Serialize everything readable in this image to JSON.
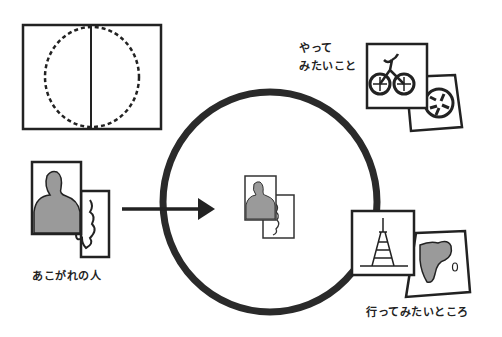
{
  "diagram": {
    "colors": {
      "ink": "#222222",
      "fill_gray": "#9a9a9a",
      "background": "#ffffff"
    },
    "labels": {
      "want_to_do_line1": "やって",
      "want_to_do_line2": "みたいこと",
      "admired_person": "あこがれの人",
      "want_to_go": "行ってみたいところ"
    },
    "elements": [
      {
        "id": "book-dashed-circle",
        "description": "rectangle with dashed circle and center line"
      },
      {
        "id": "admired-person-cards",
        "description": "silhouette photo card with hand card"
      },
      {
        "id": "arrow",
        "description": "arrow pointing into circle"
      },
      {
        "id": "big-circle",
        "description": "large hand-drawn circle"
      },
      {
        "id": "center-cards",
        "description": "small silhouette and hand cards inside circle"
      },
      {
        "id": "want-to-do-cards",
        "description": "bicycle card and soccer ball card"
      },
      {
        "id": "want-to-go-cards",
        "description": "tower card and map card"
      }
    ]
  }
}
